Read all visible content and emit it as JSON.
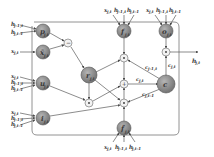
{
  "diagram": {
    "type": "gated recurrent cell (2D LSTM-like)",
    "colors": {
      "node_fill": "#8a8a8a",
      "node_stroke": "#555555",
      "op_fill": "#f2f2f2",
      "line": "#5a5a5a",
      "frame": "#777777",
      "text": "#3a3a3a"
    },
    "inputs": {
      "p_gate": [
        "h",
        "h"
      ],
      "p_gate_subs": [
        "j-1,t",
        "j,t-1"
      ],
      "x_tilde": {
        "base": "x",
        "sub": "j,t"
      },
      "u_gate": {
        "bases": [
          "x",
          "h",
          "h"
        ],
        "subs": [
          "j,t",
          "j-1,t",
          "j,t-1"
        ]
      },
      "i_gate": {
        "bases": [
          "x",
          "h",
          "h"
        ],
        "subs": [
          "j,t",
          "j-1,t",
          "j,t-1"
        ]
      },
      "f_top": {
        "bases": [
          "x",
          "h",
          "h"
        ],
        "subs": [
          "j,t",
          "j-1,t",
          "j,t-1"
        ]
      },
      "o_gate": {
        "bases": [
          "x",
          "h",
          "h"
        ],
        "subs": [
          "j,t",
          "j-1,t",
          "j,t-1"
        ]
      },
      "f_bottom": {
        "bases": [
          "x",
          "h",
          "h"
        ],
        "subs": [
          "j,t",
          "j-1,t",
          "j,t-1"
        ]
      }
    },
    "nodes": [
      {
        "id": "p",
        "base": "p",
        "sub": "j,t"
      },
      {
        "id": "xtilde",
        "base": "x̃",
        "sub": "j,t"
      },
      {
        "id": "u",
        "base": "u",
        "sub": "j,t"
      },
      {
        "id": "i",
        "base": "i",
        "sub": "j,t"
      },
      {
        "id": "r",
        "base": "r",
        "sub": "j,t"
      },
      {
        "id": "f",
        "base": "f",
        "sub": "j,t"
      },
      {
        "id": "o",
        "base": "o",
        "sub": "j,t"
      },
      {
        "id": "c",
        "base": "c",
        "sub": "j,t"
      },
      {
        "id": "ftilde",
        "base": "f̃",
        "sub": "j,t"
      }
    ],
    "ops": {
      "minus": "−",
      "mult": "⊙",
      "plus": "+"
    },
    "edge_labels": {
      "c_jm1": {
        "base": "c",
        "sub": "j-1,t"
      },
      "c_jt": {
        "base": "c",
        "sub": "j,t"
      },
      "c_jtm1": {
        "base": "c",
        "sub": "j,t-1"
      },
      "c_out": {
        "base": "c",
        "sub": "j,t"
      }
    },
    "output": {
      "base": "h",
      "sub": "j,t"
    }
  }
}
